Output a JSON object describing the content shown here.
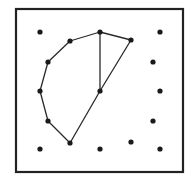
{
  "figure": {
    "type": "geoboard-dot-grid",
    "frame": {
      "x": 16,
      "y": 9,
      "width": 167,
      "height": 163,
      "stroke": "#222222",
      "stroke_width": 2.2
    },
    "colors": {
      "line": "#2a2a2a",
      "dot": "#1a1a1a",
      "background": "#ffffff"
    },
    "dots": [
      {
        "id": "d1",
        "x": 40,
        "y": 32
      },
      {
        "id": "d2",
        "x": 100,
        "y": 32
      },
      {
        "id": "d3",
        "x": 160,
        "y": 32
      },
      {
        "id": "d4",
        "x": 70,
        "y": 41
      },
      {
        "id": "d5",
        "x": 131,
        "y": 40
      },
      {
        "id": "d6",
        "x": 48,
        "y": 62
      },
      {
        "id": "d7",
        "x": 153,
        "y": 62
      },
      {
        "id": "d8",
        "x": 40,
        "y": 91
      },
      {
        "id": "d9",
        "x": 100,
        "y": 91
      },
      {
        "id": "d10",
        "x": 160,
        "y": 91
      },
      {
        "id": "d11",
        "x": 48,
        "y": 121
      },
      {
        "id": "d12",
        "x": 153,
        "y": 121
      },
      {
        "id": "d13",
        "x": 70,
        "y": 143
      },
      {
        "id": "d14",
        "x": 131,
        "y": 142
      },
      {
        "id": "d15",
        "x": 40,
        "y": 149
      },
      {
        "id": "d16",
        "x": 100,
        "y": 149
      },
      {
        "id": "d17",
        "x": 160,
        "y": 149
      }
    ],
    "polygon": {
      "vertices": [
        "d2",
        "d4",
        "d6",
        "d8",
        "d11",
        "d13",
        "d9",
        "d5"
      ],
      "closed": true
    },
    "chords": [
      {
        "from": "d2",
        "to": "d9"
      }
    ],
    "dot_radius": 2.6,
    "line_width": 1.3
  }
}
